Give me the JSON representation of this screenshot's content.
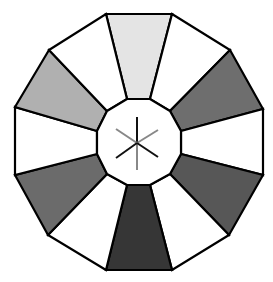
{
  "diagram": {
    "title": "",
    "shape": "dodecagon-wheel",
    "outline_color": "#000000",
    "center": {
      "x": 139,
      "y": 142
    },
    "segments": [
      {
        "id": "top",
        "fill": "#e4e4e4",
        "points": "106,14 172,14 150,99 127,99"
      },
      {
        "id": "top-right",
        "fill": "#ffffff",
        "points": "172,14 230,50 170,111 150,99"
      },
      {
        "id": "right-upper",
        "fill": "#6e6e6e",
        "points": "230,50 263,109 181,131 170,111"
      },
      {
        "id": "right",
        "fill": "#ffffff",
        "points": "263,109 263,175 181,154 181,131"
      },
      {
        "id": "right-lower",
        "fill": "#575757",
        "points": "263,175 229,235 170,174 181,154"
      },
      {
        "id": "bottom-right",
        "fill": "#ffffff",
        "points": "229,235 172,270 150,185 170,174"
      },
      {
        "id": "bottom",
        "fill": "#363636",
        "points": "172,270 106,270 127,185 150,185"
      },
      {
        "id": "bottom-left",
        "fill": "#ffffff",
        "points": "106,270 48,235 107,174 127,185"
      },
      {
        "id": "left-lower",
        "fill": "#6b6b6b",
        "points": "48,235 15,175 97,154 107,174"
      },
      {
        "id": "left",
        "fill": "#ffffff",
        "points": "15,175 15,107 97,131 97,154"
      },
      {
        "id": "left-upper",
        "fill": "#b0b0b0",
        "points": "15,107 49,50 107,111 97,131"
      },
      {
        "id": "top-left",
        "fill": "#ffffff",
        "points": "49,50 106,14 127,99 107,111"
      }
    ],
    "hub": {
      "fill": "#ffffff",
      "points": "127,99 150,99 170,111 181,131 181,154 170,174 150,185 127,185 107,174 97,154 97,131 107,111"
    },
    "star": {
      "rays": [
        {
          "id": "up",
          "x2": 137,
          "y2": 117,
          "color": "#111111"
        },
        {
          "id": "down",
          "x2": 137,
          "y2": 170,
          "color": "#888888"
        },
        {
          "id": "upper-left",
          "x2": 116,
          "y2": 129,
          "color": "#888888"
        },
        {
          "id": "upper-right",
          "x2": 158,
          "y2": 130,
          "color": "#888888"
        },
        {
          "id": "lower-left",
          "x2": 116,
          "y2": 158,
          "color": "#111111"
        },
        {
          "id": "lower-right",
          "x2": 158,
          "y2": 157,
          "color": "#111111"
        }
      ],
      "origin": {
        "x": 137,
        "y": 143
      }
    }
  }
}
